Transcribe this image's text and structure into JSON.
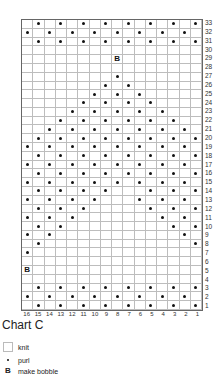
{
  "chart_data": {
    "type": "table",
    "title": "Chart C",
    "columns": [
      16,
      15,
      14,
      13,
      12,
      11,
      10,
      9,
      8,
      7,
      6,
      5,
      4,
      3,
      2,
      1
    ],
    "rows_count": 33,
    "cell_default": "knit",
    "note": "Stitches listed per row by stitch number (16 = left, 1 = right)",
    "rows": {
      "33": {
        "purl": [
          15,
          13,
          11,
          9,
          7,
          5,
          3,
          1
        ],
        "bobble": []
      },
      "32": {
        "purl": [
          16,
          14,
          12,
          10,
          8,
          6,
          4,
          2
        ],
        "bobble": []
      },
      "31": {
        "purl": [
          15,
          13,
          11,
          9,
          7,
          5,
          3,
          1
        ],
        "bobble": []
      },
      "30": {
        "purl": [],
        "bobble": []
      },
      "29": {
        "purl": [],
        "bobble": [
          8
        ]
      },
      "28": {
        "purl": [],
        "bobble": []
      },
      "27": {
        "purl": [
          8
        ],
        "bobble": []
      },
      "26": {
        "purl": [
          9,
          7
        ],
        "bobble": []
      },
      "25": {
        "purl": [
          10,
          8,
          6
        ],
        "bobble": []
      },
      "24": {
        "purl": [
          11,
          9,
          7,
          5
        ],
        "bobble": []
      },
      "23": {
        "purl": [
          12,
          10,
          8,
          6,
          4
        ],
        "bobble": []
      },
      "22": {
        "purl": [
          13,
          11,
          9,
          7,
          5,
          3
        ],
        "bobble": []
      },
      "21": {
        "purl": [
          14,
          12,
          10,
          8,
          6,
          4,
          2
        ],
        "bobble": []
      },
      "20": {
        "purl": [
          15,
          13,
          11,
          9,
          7,
          5,
          3,
          1
        ],
        "bobble": []
      },
      "19": {
        "purl": [
          16,
          14,
          12,
          10,
          8,
          6,
          4,
          2
        ],
        "bobble": []
      },
      "18": {
        "purl": [
          15,
          13,
          11,
          9,
          7,
          5,
          3,
          1
        ],
        "bobble": []
      },
      "17": {
        "purl": [
          16,
          14,
          12,
          10,
          8,
          6,
          4,
          2
        ],
        "bobble": []
      },
      "16": {
        "purl": [
          15,
          13,
          11,
          9,
          7,
          5,
          3,
          1
        ],
        "bobble": []
      },
      "15": {
        "purl": [
          16,
          14,
          12,
          10,
          8,
          6,
          4,
          2
        ],
        "bobble": []
      },
      "14": {
        "purl": [
          15,
          13,
          11,
          9,
          5,
          3,
          1
        ],
        "bobble": []
      },
      "13": {
        "purl": [
          16,
          14,
          12,
          10,
          6,
          4,
          2
        ],
        "bobble": []
      },
      "12": {
        "purl": [
          15,
          13,
          11,
          5,
          3,
          1
        ],
        "bobble": []
      },
      "11": {
        "purl": [
          16,
          14,
          12,
          4,
          2
        ],
        "bobble": []
      },
      "10": {
        "purl": [
          15,
          13,
          3,
          1
        ],
        "bobble": []
      },
      "9": {
        "purl": [
          16,
          14,
          2
        ],
        "bobble": []
      },
      "8": {
        "purl": [
          15,
          1
        ],
        "bobble": []
      },
      "7": {
        "purl": [
          16
        ],
        "bobble": []
      },
      "6": {
        "purl": [],
        "bobble": []
      },
      "5": {
        "purl": [],
        "bobble": [
          16
        ]
      },
      "4": {
        "purl": [],
        "bobble": []
      },
      "3": {
        "purl": [
          15,
          13,
          11,
          9,
          7,
          5,
          3,
          1
        ],
        "bobble": []
      },
      "2": {
        "purl": [
          16,
          14,
          12,
          10,
          8,
          6,
          4,
          2
        ],
        "bobble": []
      },
      "1": {
        "purl": [
          15,
          13,
          11,
          9,
          7,
          5,
          3,
          1
        ],
        "bobble": []
      }
    },
    "legend": [
      {
        "symbol": "empty",
        "label": "knit"
      },
      {
        "symbol": "dot",
        "label": "purl"
      },
      {
        "symbol": "B",
        "label": "make bobble"
      }
    ]
  },
  "title": "Chart C",
  "bobble_glyph": "B",
  "legend": {
    "knit": "knit",
    "purl": "purl",
    "bobble": "make bobble",
    "bobble_symbol": "B"
  }
}
